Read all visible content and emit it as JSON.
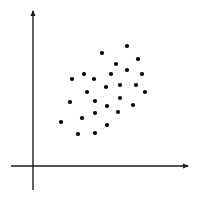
{
  "chart_data": {
    "type": "scatter",
    "title": "",
    "xlabel": "",
    "ylabel": "",
    "xlim": [
      -22,
      155
    ],
    "ylim": [
      -24,
      155
    ],
    "grid": false,
    "legend": null,
    "axes_style": "arrowed axes crossing near origin, no ticks or labels",
    "colors": {
      "axis": "#1a1a1a",
      "point": "#000000",
      "background": "#ffffff"
    },
    "series": [
      {
        "name": "points",
        "points": [
          {
            "x": 69,
            "y": 113
          },
          {
            "x": 94,
            "y": 120
          },
          {
            "x": 105,
            "y": 107
          },
          {
            "x": 83,
            "y": 102
          },
          {
            "x": 94,
            "y": 96
          },
          {
            "x": 78,
            "y": 92
          },
          {
            "x": 109,
            "y": 92
          },
          {
            "x": 39,
            "y": 87
          },
          {
            "x": 51,
            "y": 92
          },
          {
            "x": 61,
            "y": 87
          },
          {
            "x": 87,
            "y": 81
          },
          {
            "x": 103,
            "y": 81
          },
          {
            "x": 73,
            "y": 79
          },
          {
            "x": 112,
            "y": 74
          },
          {
            "x": 54,
            "y": 74
          },
          {
            "x": 62,
            "y": 65
          },
          {
            "x": 87,
            "y": 68
          },
          {
            "x": 37,
            "y": 64
          },
          {
            "x": 74,
            "y": 60
          },
          {
            "x": 100,
            "y": 61
          },
          {
            "x": 85,
            "y": 54
          },
          {
            "x": 62,
            "y": 53
          },
          {
            "x": 49,
            "y": 48
          },
          {
            "x": 28,
            "y": 44
          },
          {
            "x": 74,
            "y": 41
          },
          {
            "x": 45,
            "y": 32
          },
          {
            "x": 62,
            "y": 33
          }
        ]
      }
    ]
  }
}
